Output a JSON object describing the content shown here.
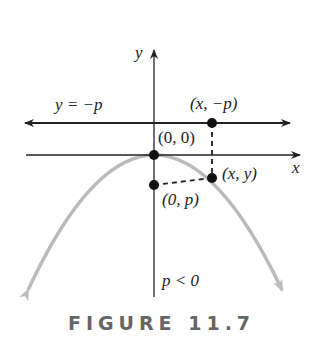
{
  "figure": {
    "caption": "FIGURE 11.7",
    "labels": {
      "y_axis": "y",
      "x_axis": "x",
      "directrix": "y = −p",
      "point_directrix": "(x, −p)",
      "origin": "(0, 0)",
      "point_curve": "(x, y)",
      "focus": "(0, p)",
      "condition": "p < 0"
    },
    "colors": {
      "parabola": "#bbbbbb",
      "lines": "#222222",
      "caption": "#666666"
    }
  }
}
